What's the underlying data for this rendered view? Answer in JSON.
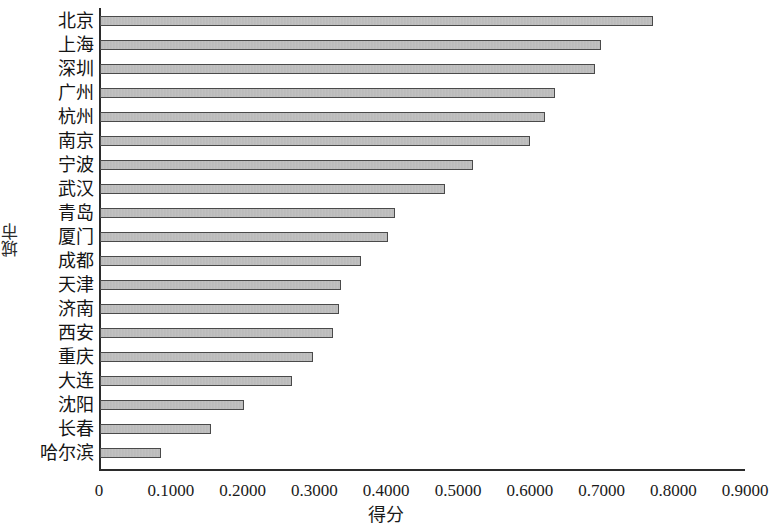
{
  "chart_data": {
    "type": "bar",
    "orientation": "horizontal",
    "title": "",
    "xlabel": "得分",
    "ylabel": "城市",
    "xlim": [
      0,
      0.9
    ],
    "grid": false,
    "legend": null,
    "xticks": [
      "0",
      "0.1000",
      "0.2000",
      "0.3000",
      "0.4000",
      "0.5000",
      "0.6000",
      "0.7000",
      "0.8000",
      "0.9000"
    ],
    "xtick_values": [
      0,
      0.1,
      0.2,
      0.3,
      0.4,
      0.5,
      0.6,
      0.7,
      0.8,
      0.9
    ],
    "categories": [
      "北京",
      "上海",
      "深圳",
      "广州",
      "杭州",
      "南京",
      "宁波",
      "武汉",
      "青岛",
      "厦门",
      "成都",
      "天津",
      "济南",
      "西安",
      "重庆",
      "大连",
      "沈阳",
      "长春",
      "哈尔滨"
    ],
    "values": [
      0.77,
      0.698,
      0.69,
      0.634,
      0.62,
      0.599,
      0.52,
      0.481,
      0.411,
      0.401,
      0.364,
      0.336,
      0.333,
      0.325,
      0.297,
      0.268,
      0.2,
      0.154,
      0.085
    ],
    "bar_color": "#bdbdbd",
    "bar_edge_color": "#4a4a4a"
  },
  "axes": {
    "x_title": "得分",
    "y_title": "城市"
  }
}
